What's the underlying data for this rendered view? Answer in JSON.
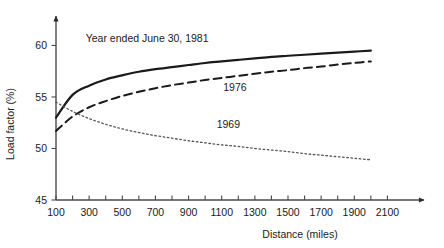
{
  "chart_data": {
    "type": "line",
    "title": "",
    "xlabel": "Distance (miles)",
    "ylabel": "Load factor (%)",
    "xlim": [
      100,
      2200
    ],
    "ylim": [
      45,
      61.5
    ],
    "grid": false,
    "legend_position": "inline-annotations",
    "xticks": [
      100,
      300,
      500,
      700,
      900,
      1100,
      1300,
      1500,
      1700,
      1900,
      2100
    ],
    "xtick_labels": [
      "100",
      "300",
      "500",
      "700",
      "900",
      "1100",
      "1300",
      "1500",
      "1700",
      "1900",
      "2100"
    ],
    "xminor_ticks": [
      200,
      400,
      600,
      800,
      1000,
      1200,
      1400,
      1600,
      1800,
      2000
    ],
    "yticks": [
      45,
      50,
      55,
      60
    ],
    "ytick_labels": [
      "45",
      "50",
      "55",
      "60"
    ],
    "x": [
      100,
      200,
      300,
      400,
      500,
      600,
      700,
      800,
      900,
      1000,
      1100,
      1200,
      1300,
      1400,
      1500,
      1600,
      1700,
      1800,
      1900,
      2000
    ],
    "series": [
      {
        "name": "Year ended June 30, 1981",
        "label": "Year ended June 30, 1981",
        "style": "solid",
        "color": "#1a1a1a",
        "width": 2.2,
        "label_x": 650,
        "label_y": 60.3,
        "values": [
          53.0,
          55.2,
          56.1,
          56.7,
          57.1,
          57.45,
          57.7,
          57.9,
          58.1,
          58.3,
          58.45,
          58.6,
          58.75,
          58.9,
          59.0,
          59.1,
          59.2,
          59.3,
          59.4,
          59.5
        ]
      },
      {
        "name": "1976",
        "label": "1976",
        "style": "dashed",
        "color": "#1a1a1a",
        "width": 2.0,
        "label_x": 1180,
        "label_y": 55.6,
        "values": [
          51.7,
          53.1,
          54.0,
          54.6,
          55.1,
          55.5,
          55.85,
          56.15,
          56.4,
          56.65,
          56.85,
          57.05,
          57.25,
          57.45,
          57.6,
          57.8,
          57.95,
          58.15,
          58.3,
          58.45
        ]
      },
      {
        "name": "1969",
        "label": "1969",
        "style": "dotted",
        "color": "#555555",
        "width": 1.3,
        "label_x": 1140,
        "label_y": 52.0,
        "values": [
          54.5,
          53.6,
          52.9,
          52.35,
          51.9,
          51.55,
          51.25,
          51.0,
          50.75,
          50.55,
          50.35,
          50.2,
          50.0,
          49.85,
          49.7,
          49.5,
          49.35,
          49.2,
          49.05,
          48.9
        ]
      }
    ]
  },
  "axes": {
    "y_title": "Load factor (%)",
    "x_title": "Distance (miles)"
  }
}
